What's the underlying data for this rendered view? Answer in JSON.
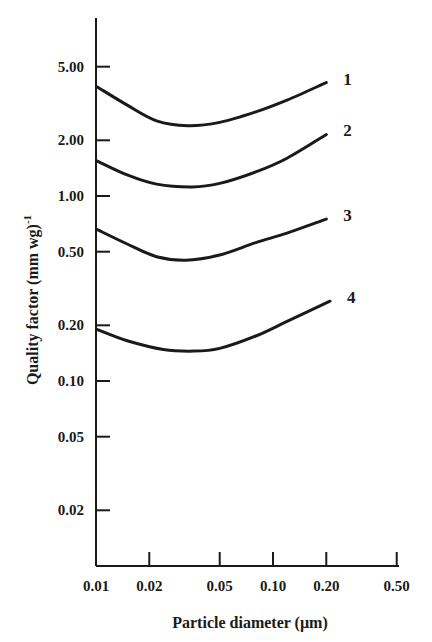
{
  "chart_data": {
    "type": "line",
    "title": "",
    "xlabel": "Particle diameter (µm)",
    "ylabel": "Quality factor (mm wg)",
    "ylabel_superscript": "-1",
    "xscale": "log",
    "yscale": "log",
    "xlim": [
      0.01,
      0.5
    ],
    "ylim": [
      0.01,
      10
    ],
    "grid": false,
    "legend": "inline curve labels at right ends",
    "x_ticks": [
      {
        "value": 0.01,
        "label": "0.01"
      },
      {
        "value": 0.02,
        "label": "0.02"
      },
      {
        "value": 0.05,
        "label": "0.05"
      },
      {
        "value": 0.1,
        "label": "0.10"
      },
      {
        "value": 0.2,
        "label": "0.20"
      },
      {
        "value": 0.5,
        "label": "0.50"
      }
    ],
    "y_ticks": [
      {
        "value": 5.0,
        "label": "5.00"
      },
      {
        "value": 2.0,
        "label": "2.00"
      },
      {
        "value": 1.0,
        "label": "1.00"
      },
      {
        "value": 0.5,
        "label": "0.50"
      },
      {
        "value": 0.2,
        "label": "0.20"
      },
      {
        "value": 0.1,
        "label": "0.10"
      },
      {
        "value": 0.05,
        "label": "0.05"
      },
      {
        "value": 0.02,
        "label": "0.02"
      }
    ],
    "series": [
      {
        "name": "1",
        "x": [
          0.0101,
          0.015,
          0.022,
          0.033,
          0.05,
          0.08,
          0.12,
          0.2
        ],
        "y": [
          3.9,
          3.1,
          2.55,
          2.4,
          2.5,
          2.85,
          3.3,
          4.1
        ]
      },
      {
        "name": "2",
        "x": [
          0.0101,
          0.015,
          0.022,
          0.035,
          0.05,
          0.08,
          0.12,
          0.2
        ],
        "y": [
          1.55,
          1.3,
          1.16,
          1.12,
          1.17,
          1.35,
          1.6,
          2.15
        ]
      },
      {
        "name": "3",
        "x": [
          0.0101,
          0.015,
          0.022,
          0.032,
          0.05,
          0.08,
          0.12,
          0.2
        ],
        "y": [
          0.66,
          0.55,
          0.47,
          0.45,
          0.48,
          0.56,
          0.63,
          0.75
        ]
      },
      {
        "name": "4",
        "x": [
          0.0101,
          0.015,
          0.024,
          0.036,
          0.05,
          0.08,
          0.12,
          0.21
        ],
        "y": [
          0.19,
          0.165,
          0.148,
          0.145,
          0.15,
          0.175,
          0.21,
          0.27
        ]
      }
    ]
  }
}
